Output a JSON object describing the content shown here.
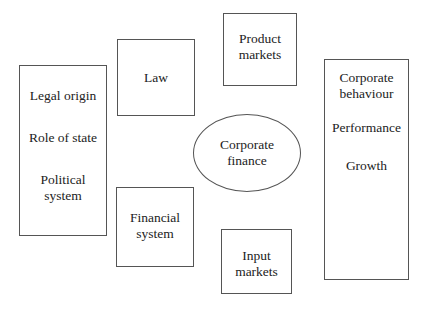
{
  "diagram": {
    "left_box": {
      "items": [
        "Legal origin",
        "Role of state",
        "Political\nsystem"
      ]
    },
    "law_box": {
      "label": "Law"
    },
    "product_markets_box": {
      "label": "Product\nmarkets"
    },
    "center_ellipse": {
      "label": "Corporate\nfinance"
    },
    "financial_system_box": {
      "label": "Financial\nsystem"
    },
    "input_markets_box": {
      "label": "Input\nmarkets"
    },
    "right_box": {
      "items": [
        "Corporate\nbehaviour",
        "Performance",
        "Growth"
      ]
    }
  }
}
